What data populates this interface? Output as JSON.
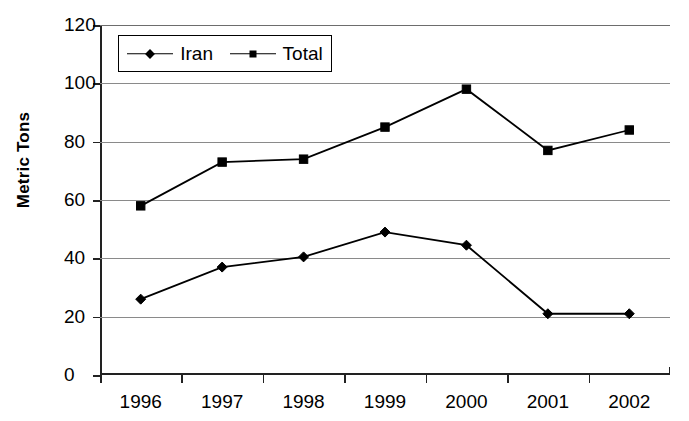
{
  "chart_data": {
    "type": "line",
    "title": "",
    "xlabel": "",
    "ylabel": "Metric Tons",
    "categories": [
      "1996",
      "1997",
      "1998",
      "1999",
      "2000",
      "2001",
      "2002"
    ],
    "ylim": [
      0,
      120
    ],
    "yticks": [
      0,
      20,
      40,
      60,
      80,
      100,
      120
    ],
    "grid": true,
    "legend_position": "top-left-inside",
    "series": [
      {
        "name": "Iran",
        "marker": "diamond",
        "color": "#000000",
        "values": [
          26,
          37,
          40.5,
          49,
          44.5,
          21,
          21
        ]
      },
      {
        "name": "Total",
        "marker": "square",
        "color": "#000000",
        "values": [
          58,
          73,
          74,
          85,
          98,
          77,
          84
        ]
      }
    ]
  },
  "axis": {
    "ytick_labels": [
      "120",
      "100",
      "80",
      "60",
      "40",
      "20",
      "0"
    ]
  },
  "legend": {
    "entries": [
      {
        "label": "Iran",
        "marker": "diamond"
      },
      {
        "label": "Total",
        "marker": "square"
      }
    ]
  }
}
